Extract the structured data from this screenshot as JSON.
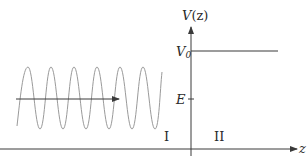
{
  "diagram": {
    "type": "potential-step",
    "colors": {
      "axis": "#3a3a3a",
      "wave": "#9a9a9a",
      "potential": "#3a3a3a",
      "text": "#2a2a2a"
    },
    "axes": {
      "vertical_label": "V(z)",
      "vertical_label_main": "V",
      "vertical_label_arg": "(z)",
      "horizontal_label": "z"
    },
    "levels": {
      "V0_label_main": "V",
      "V0_label_sub": "0",
      "E_label": "E"
    },
    "regions": {
      "left": "I",
      "right": "II"
    },
    "wave": {
      "description": "incident sinusoidal wave in region I with propagation arrow pointing right",
      "cycles": 6
    }
  }
}
